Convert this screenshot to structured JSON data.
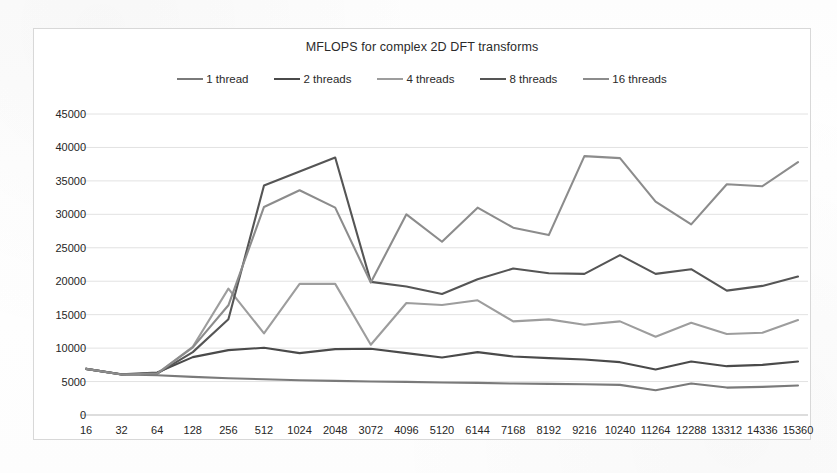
{
  "chart_data": {
    "type": "line",
    "title": "MFLOPS for complex 2D DFT transforms",
    "xlabel": "",
    "ylabel": "",
    "ylim": [
      0,
      45000
    ],
    "ytick_step": 5000,
    "yticks": [
      "0",
      "5000",
      "10000",
      "15000",
      "20000",
      "25000",
      "30000",
      "35000",
      "40000",
      "45000"
    ],
    "grid": true,
    "legend_position": "top",
    "categories": [
      "16",
      "32",
      "64",
      "128",
      "256",
      "512",
      "1024",
      "2048",
      "3072",
      "4096",
      "5120",
      "6144",
      "7168",
      "8192",
      "9216",
      "10240",
      "11264",
      "12288",
      "13312",
      "14336",
      "15360"
    ],
    "series": [
      {
        "name": "1 thread",
        "color": "#7a7a7a",
        "values": [
          6900,
          6050,
          5950,
          5700,
          5500,
          5350,
          5200,
          5100,
          5000,
          4950,
          4850,
          4800,
          4700,
          4650,
          4600,
          4500,
          3700,
          4700,
          4100,
          4200,
          4400
        ]
      },
      {
        "name": "2 threads",
        "color": "#4a4a4a",
        "values": [
          6900,
          6100,
          6350,
          8650,
          9700,
          10050,
          9250,
          9850,
          9900,
          9250,
          8600,
          9400,
          8750,
          8500,
          8300,
          7900,
          6800,
          8000,
          7300,
          7500,
          8000
        ]
      },
      {
        "name": "4 threads",
        "color": "#9d9d9d",
        "values": [
          6900,
          6050,
          6200,
          10200,
          18900,
          12200,
          19600,
          19600,
          10500,
          16750,
          16450,
          17150,
          14000,
          14300,
          13500,
          14000,
          11700,
          13800,
          12100,
          12300,
          14200
        ]
      },
      {
        "name": "8 threads",
        "color": "#555555",
        "values": [
          6900,
          6050,
          6200,
          9400,
          14300,
          34300,
          36400,
          38500,
          19900,
          19200,
          18100,
          20300,
          21900,
          21200,
          21100,
          23900,
          21100,
          21800,
          18600,
          19300,
          20700
        ]
      },
      {
        "name": "16 threads",
        "color": "#8c8c8c",
        "values": [
          6900,
          6050,
          6200,
          10100,
          16400,
          31100,
          33600,
          31000,
          19800,
          30000,
          25900,
          31000,
          28000,
          26900,
          38700,
          38400,
          31900,
          28500,
          34500,
          34200,
          37800
        ]
      }
    ]
  },
  "frame": {
    "border_color": "#d8d8d8",
    "plot_background": "#ffffff",
    "gridline_color": "#e2e2e2"
  }
}
